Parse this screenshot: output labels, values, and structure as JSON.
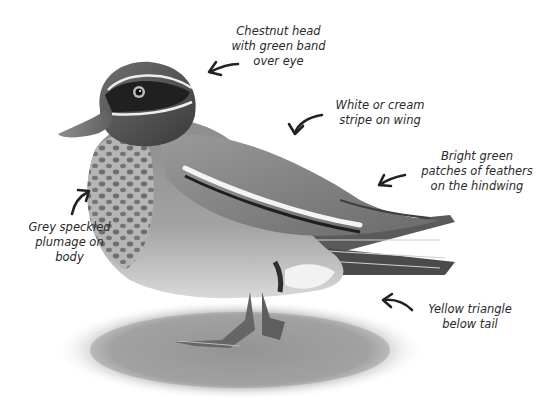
{
  "figure": {
    "style": "grayscale",
    "background": "#ffffff",
    "text_color": "#2a2a2a"
  },
  "annotations": [
    {
      "id": "head",
      "text": "Chestnut head\nwith green band\nover eye",
      "arrow": "curved-arrow-left"
    },
    {
      "id": "wing-stripe",
      "text": "White or cream\nstripe on wing",
      "arrow": "curved-arrow-down-left"
    },
    {
      "id": "hindwing",
      "text": "Bright green\npatches of feathers\non the hindwing",
      "arrow": "curved-arrow-left"
    },
    {
      "id": "body",
      "text": "Grey speckled\nplumage on\nbody",
      "arrow": "curved-arrow-up-right"
    },
    {
      "id": "tail",
      "text": "Yellow triangle\nbelow tail",
      "arrow": "curved-arrow-up-left"
    }
  ]
}
